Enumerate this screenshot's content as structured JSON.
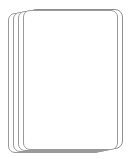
{
  "card": {
    "rank": "10",
    "suit_name": "clubs",
    "suit_symbol": "♣",
    "color": "#000000",
    "card_face_color": "#ffffff",
    "border_color": "#8f8f8f",
    "background_color": "#ffffff",
    "corners": [
      {
        "position": "top-left",
        "rank": "10",
        "pip": "club-icon",
        "rotated": false
      },
      {
        "position": "bottom-right",
        "rank": "10",
        "pip": "club-icon",
        "rotated": true
      }
    ],
    "pip_count": 10,
    "pips": [
      {
        "x": 30,
        "y": 14,
        "flipped": false
      },
      {
        "x": 70,
        "y": 14,
        "flipped": false
      },
      {
        "x": 50,
        "y": 36,
        "flipped": false
      },
      {
        "x": 30,
        "y": 50,
        "flipped": false
      },
      {
        "x": 70,
        "y": 50,
        "flipped": false
      },
      {
        "x": 30,
        "y": 90,
        "flipped": true
      },
      {
        "x": 70,
        "y": 90,
        "flipped": true
      },
      {
        "x": 50,
        "y": 104,
        "flipped": true
      },
      {
        "x": 30,
        "y": 126,
        "flipped": true
      },
      {
        "x": 70,
        "y": 126,
        "flipped": true
      }
    ]
  },
  "stack": {
    "back_card_count": 4,
    "back_cards": [
      {
        "left": 8,
        "top": 13,
        "width": 95,
        "height": 140
      },
      {
        "left": 13,
        "top": 12,
        "width": 95,
        "height": 140
      },
      {
        "left": 18,
        "top": 11,
        "width": 95,
        "height": 140
      },
      {
        "left": 23,
        "top": 10,
        "width": 95,
        "height": 140
      }
    ]
  }
}
